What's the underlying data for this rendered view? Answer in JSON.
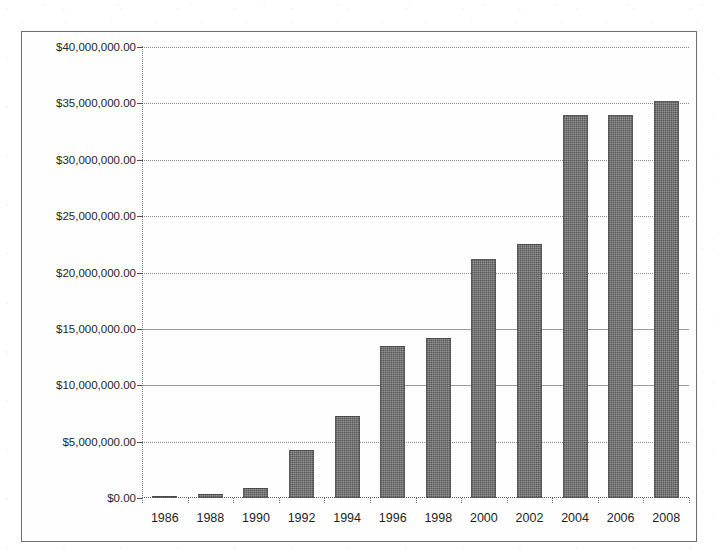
{
  "page": {
    "background_color": "#ffffff",
    "title_fragment": "............."
  },
  "frame": {
    "border_color": "#6e6e6e"
  },
  "chart_data": {
    "type": "bar",
    "title": "",
    "subtitle": "",
    "xlabel": "",
    "ylabel": "",
    "categories": [
      "1986",
      "1988",
      "1990",
      "1992",
      "1994",
      "1996",
      "1998",
      "2000",
      "2002",
      "2004",
      "2006",
      "2008"
    ],
    "values": [
      150000,
      400000,
      850000,
      4300000,
      7300000,
      13500000,
      14200000,
      21200000,
      22500000,
      34000000,
      34000000,
      35200000
    ],
    "value_labels": [
      "$150,000.00",
      "$400,000.00",
      "$850,000.00",
      "$4,300,000.00",
      "$7,300,000.00",
      "$13,500,000.00",
      "$14,200,000.00",
      "$21,200,000.00",
      "$22,500,000.00",
      "$34,000,000.00",
      "$34,000,000.00",
      "$35,200,000.00"
    ],
    "ylim": [
      0,
      40000000
    ],
    "xlim_categories": 12,
    "y_ticks": [
      0,
      5000000,
      10000000,
      15000000,
      20000000,
      25000000,
      30000000,
      35000000,
      40000000
    ],
    "y_tick_labels": [
      "$0.00",
      "$5,000,000.00",
      "$10,000,000.00",
      "$15,000,000.00",
      "$20,000,000.00",
      "$25,000,000.00",
      "$30,000,000.00",
      "$35,000,000.00",
      "$40,000,000.00"
    ],
    "grid": true,
    "grid_style": "dotted",
    "grid_color": "#8a8a8a",
    "legend": false,
    "legend_position": "none",
    "bar_color": "#575757",
    "bar_texture": "halftone-dither",
    "orientation": "vertical"
  }
}
